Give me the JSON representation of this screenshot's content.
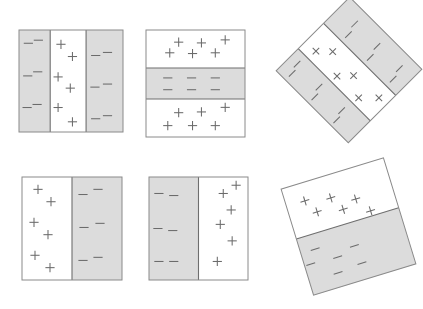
{
  "figure": {
    "canvas": {
      "width": 423,
      "height": 309,
      "background": "#ffffff"
    },
    "colors": {
      "gray_fill": "#dcdcdc",
      "white_fill": "#ffffff",
      "outline": "#8a8a8a",
      "divider": "#6e6e6e",
      "symbol": "#6b6b6b"
    },
    "symbols": {
      "positive": "+",
      "negative": "-"
    },
    "panel_count": 6,
    "panels": [
      {
        "id": "panel-1",
        "name": "three-band-vertical",
        "rotation_deg": 0,
        "x": 19,
        "y": 30,
        "w": 104,
        "h": 102,
        "band_orientation": "vertical",
        "bands": [
          {
            "fill": "gray",
            "class": "negative",
            "start": 0.0,
            "end": 0.3,
            "marks": [
              [
                0.3,
                0.13
              ],
              [
                0.62,
                0.1
              ],
              [
                0.28,
                0.45
              ],
              [
                0.6,
                0.41
              ],
              [
                0.26,
                0.76
              ],
              [
                0.58,
                0.73
              ]
            ]
          },
          {
            "fill": "white",
            "class": "positive",
            "start": 0.3,
            "end": 0.645,
            "marks": [
              [
                0.3,
                0.14
              ],
              [
                0.62,
                0.26
              ],
              [
                0.22,
                0.46
              ],
              [
                0.56,
                0.57
              ],
              [
                0.22,
                0.76
              ],
              [
                0.62,
                0.9
              ]
            ]
          },
          {
            "fill": "gray",
            "class": "negative",
            "start": 0.645,
            "end": 1.0,
            "marks": [
              [
                0.26,
                0.25
              ],
              [
                0.58,
                0.22
              ],
              [
                0.24,
                0.56
              ],
              [
                0.58,
                0.53
              ],
              [
                0.26,
                0.87
              ],
              [
                0.58,
                0.84
              ]
            ]
          }
        ]
      },
      {
        "id": "panel-2",
        "name": "three-band-horizontal",
        "rotation_deg": 0,
        "x": 146,
        "y": 30,
        "w": 99,
        "h": 107,
        "band_orientation": "horizontal",
        "bands": [
          {
            "fill": "white",
            "class": "positive",
            "start": 0.0,
            "end": 0.355,
            "marks": [
              [
                0.24,
                0.6
              ],
              [
                0.33,
                0.32
              ],
              [
                0.47,
                0.62
              ],
              [
                0.56,
                0.34
              ],
              [
                0.7,
                0.6
              ],
              [
                0.8,
                0.26
              ]
            ]
          },
          {
            "fill": "gray",
            "class": "negative",
            "start": 0.355,
            "end": 0.645,
            "marks": [
              [
                0.22,
                0.32
              ],
              [
                0.22,
                0.7
              ],
              [
                0.46,
                0.32
              ],
              [
                0.46,
                0.7
              ],
              [
                0.7,
                0.32
              ],
              [
                0.7,
                0.7
              ]
            ]
          },
          {
            "fill": "white",
            "class": "positive",
            "start": 0.645,
            "end": 1.0,
            "marks": [
              [
                0.22,
                0.7
              ],
              [
                0.33,
                0.36
              ],
              [
                0.47,
                0.7
              ],
              [
                0.56,
                0.34
              ],
              [
                0.7,
                0.7
              ],
              [
                0.8,
                0.22
              ]
            ]
          }
        ]
      },
      {
        "id": "panel-3",
        "name": "three-band-vertical-rotated",
        "rotation_deg": -45,
        "x": 297,
        "y": 19,
        "w": 104,
        "h": 102,
        "band_orientation": "vertical",
        "bands": [
          {
            "fill": "gray",
            "class": "negative",
            "start": 0.0,
            "end": 0.3,
            "marks": [
              [
                0.3,
                0.13
              ],
              [
                0.62,
                0.1
              ],
              [
                0.28,
                0.45
              ],
              [
                0.6,
                0.41
              ],
              [
                0.26,
                0.76
              ],
              [
                0.58,
                0.73
              ]
            ]
          },
          {
            "fill": "white",
            "class": "positive",
            "start": 0.3,
            "end": 0.645,
            "marks": [
              [
                0.3,
                0.14
              ],
              [
                0.62,
                0.26
              ],
              [
                0.22,
                0.46
              ],
              [
                0.56,
                0.57
              ],
              [
                0.22,
                0.76
              ],
              [
                0.62,
                0.9
              ]
            ]
          },
          {
            "fill": "gray",
            "class": "negative",
            "start": 0.645,
            "end": 1.0,
            "marks": [
              [
                0.26,
                0.25
              ],
              [
                0.58,
                0.22
              ],
              [
                0.24,
                0.56
              ],
              [
                0.58,
                0.53
              ],
              [
                0.26,
                0.87
              ],
              [
                0.58,
                0.84
              ]
            ]
          }
        ]
      },
      {
        "id": "panel-4",
        "name": "two-band-vertical-positive-left",
        "rotation_deg": 0,
        "x": 22,
        "y": 177,
        "w": 100,
        "h": 103,
        "band_orientation": "vertical",
        "bands": [
          {
            "fill": "white",
            "class": "positive",
            "start": 0.0,
            "end": 0.5,
            "marks": [
              [
                0.32,
                0.12
              ],
              [
                0.58,
                0.24
              ],
              [
                0.24,
                0.44
              ],
              [
                0.52,
                0.56
              ],
              [
                0.26,
                0.76
              ],
              [
                0.56,
                0.88
              ]
            ]
          },
          {
            "fill": "gray",
            "class": "negative",
            "start": 0.5,
            "end": 1.0,
            "marks": [
              [
                0.22,
                0.17
              ],
              [
                0.52,
                0.12
              ],
              [
                0.24,
                0.49
              ],
              [
                0.56,
                0.45
              ],
              [
                0.22,
                0.81
              ],
              [
                0.52,
                0.78
              ]
            ]
          }
        ]
      },
      {
        "id": "panel-5",
        "name": "two-band-vertical-negative-left",
        "rotation_deg": 0,
        "x": 149,
        "y": 177,
        "w": 99,
        "h": 103,
        "band_orientation": "vertical",
        "bands": [
          {
            "fill": "gray",
            "class": "negative",
            "start": 0.0,
            "end": 0.5,
            "marks": [
              [
                0.2,
                0.16
              ],
              [
                0.5,
                0.18
              ],
              [
                0.18,
                0.5
              ],
              [
                0.48,
                0.52
              ],
              [
                0.2,
                0.82
              ],
              [
                0.5,
                0.82
              ]
            ]
          },
          {
            "fill": "white",
            "class": "positive",
            "start": 0.5,
            "end": 1.0,
            "marks": [
              [
                0.5,
                0.16
              ],
              [
                0.76,
                0.08
              ],
              [
                0.66,
                0.32
              ],
              [
                0.44,
                0.46
              ],
              [
                0.68,
                0.62
              ],
              [
                0.38,
                0.82
              ]
            ]
          }
        ]
      },
      {
        "id": "panel-6",
        "name": "two-band-horizontal-rotated",
        "rotation_deg": -17,
        "x": 295,
        "y": 171,
        "w": 107,
        "h": 111,
        "band_orientation": "horizontal",
        "bands": [
          {
            "fill": "white",
            "class": "positive",
            "start": 0.0,
            "end": 0.47,
            "marks": [
              [
                0.18,
                0.35
              ],
              [
                0.26,
                0.62
              ],
              [
                0.42,
                0.44
              ],
              [
                0.5,
                0.72
              ],
              [
                0.64,
                0.6
              ],
              [
                0.74,
                0.9
              ]
            ]
          },
          {
            "fill": "gray",
            "class": "negative",
            "start": 0.47,
            "end": 1.0,
            "marks": [
              [
                0.14,
                0.26
              ],
              [
                0.06,
                0.48
              ],
              [
                0.32,
                0.5
              ],
              [
                0.28,
                0.76
              ],
              [
                0.52,
                0.72
              ],
              [
                0.5,
                0.4
              ]
            ]
          }
        ]
      }
    ]
  }
}
